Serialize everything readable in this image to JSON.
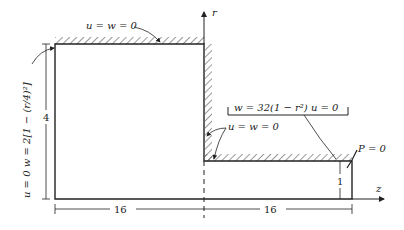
{
  "diagram": {
    "axes": {
      "r_label": "r",
      "z_label": "z"
    },
    "boundary_conditions": {
      "top_wall": "u = w = 0",
      "step_wall": "u = w = 0",
      "inlet": "u = 0    w = 2[1 − (r/4)²]",
      "outlet_inlet": "w = 32(1 − r²)    u = 0",
      "outlet": "P = 0"
    },
    "dimensions": {
      "left_length": "16",
      "right_length": "16",
      "inlet_height": "4",
      "outlet_height": "1"
    },
    "colors": {
      "line": "#222222",
      "background": "#ffffff"
    }
  }
}
